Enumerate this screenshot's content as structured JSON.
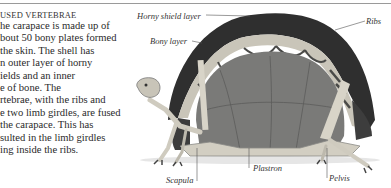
{
  "section": {
    "heading": "USED VERTEBRAE",
    "body_lines": [
      "he carapace is made up of",
      "bout 50 bony plates formed",
      " the skin. The shell has",
      "n outer layer of horny",
      "ields and an inner",
      "e of bone. The",
      "rtebrae, with the ribs and",
      "e two limb girdles, are fused",
      " the carapace. This has",
      "sulted in the limb girdles",
      "ing inside the ribs."
    ]
  },
  "figure": {
    "labels": {
      "horny_shield_layer": "Horny shield layer",
      "bony_layer": "Bony layer",
      "ribs": "Ribs",
      "scapula": "Scapula",
      "plastron": "Plastron",
      "pelvis": "Pelvis"
    },
    "colors": {
      "shell_dark": "#3a3a3a",
      "bone_light": "#d8d4c8",
      "interior": "#7c7c7a",
      "line": "#555555"
    }
  }
}
